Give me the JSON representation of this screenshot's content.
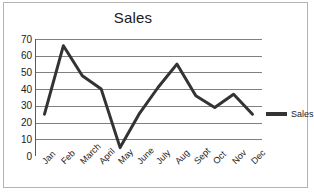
{
  "chart_data": {
    "type": "line",
    "title": "Sales",
    "xlabel": "",
    "ylabel": "",
    "categories": [
      "Jan",
      "Feb",
      "March",
      "April",
      "May",
      "June",
      "July",
      "Aug",
      "Sept",
      "Oct",
      "Nov",
      "Dec"
    ],
    "series": [
      {
        "name": "Sales",
        "color": "#333333",
        "values": [
          25,
          66,
          48,
          40,
          5,
          25,
          41,
          55,
          36,
          29,
          37,
          25
        ]
      }
    ],
    "ylim": [
      0,
      70
    ],
    "yticks": [
      0,
      10,
      20,
      30,
      40,
      50,
      60,
      70
    ],
    "ytick_labels": [
      "0",
      "10",
      "20",
      "30",
      "40",
      "50",
      "60",
      "70"
    ],
    "grid": true,
    "grid_color": "#808080",
    "legend": {
      "position": "right",
      "entries": [
        "Sales"
      ]
    }
  },
  "legend": {
    "label": "Sales"
  },
  "frame": {
    "border_color": "#b4b4b4",
    "background": "#ffffff"
  }
}
